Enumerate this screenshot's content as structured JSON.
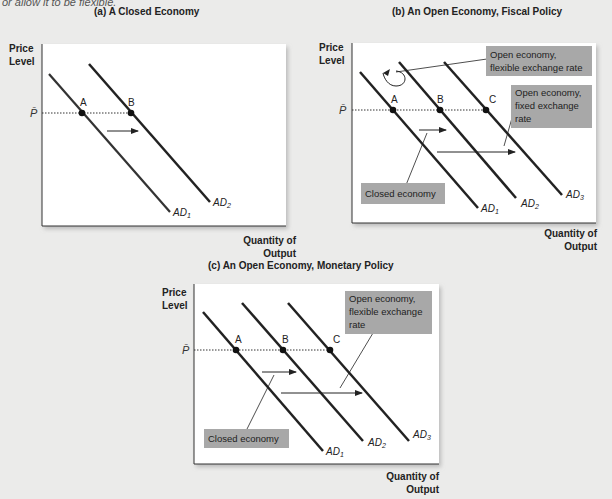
{
  "caption": "or allow it to be flexible.",
  "panels": {
    "a": {
      "title": "(a) A Closed Economy",
      "ylabel_1": "Price",
      "ylabel_2": "Level",
      "xlabel_1": "Quantity of",
      "xlabel_2": "Output",
      "pbar": "P̄",
      "points": [
        "A",
        "B"
      ],
      "curves": [
        "AD1",
        "AD2"
      ]
    },
    "b": {
      "title": "(b) An Open Economy, Fiscal Policy",
      "ylabel_1": "Price",
      "ylabel_2": "Level",
      "xlabel_1": "Quantity of",
      "xlabel_2": "Output",
      "pbar": "P̄",
      "points": [
        "A",
        "B",
        "C"
      ],
      "curves": [
        "AD1",
        "AD2",
        "AD3"
      ],
      "callouts": {
        "flexible": [
          "Open economy,",
          "flexible exchange rate"
        ],
        "fixed": [
          "Open economy,",
          "fixed exchange",
          "rate"
        ],
        "closed": [
          "Closed economy"
        ]
      }
    },
    "c": {
      "title": "(c) An Open Economy, Monetary Policy",
      "ylabel_1": "Price",
      "ylabel_2": "Level",
      "xlabel_1": "Quantity of",
      "xlabel_2": "Output",
      "pbar": "P̄",
      "points": [
        "A",
        "B",
        "C"
      ],
      "curves": [
        "AD1",
        "AD2",
        "AD3"
      ],
      "callouts": {
        "flexible": [
          "Open economy,",
          "flexible exchange",
          "rate"
        ],
        "closed": [
          "Closed economy"
        ]
      }
    }
  },
  "colors": {
    "background": "#ebebea",
    "panel": "#ffffff",
    "curve": "#222222",
    "callout_fill": "#a8a8a8"
  }
}
